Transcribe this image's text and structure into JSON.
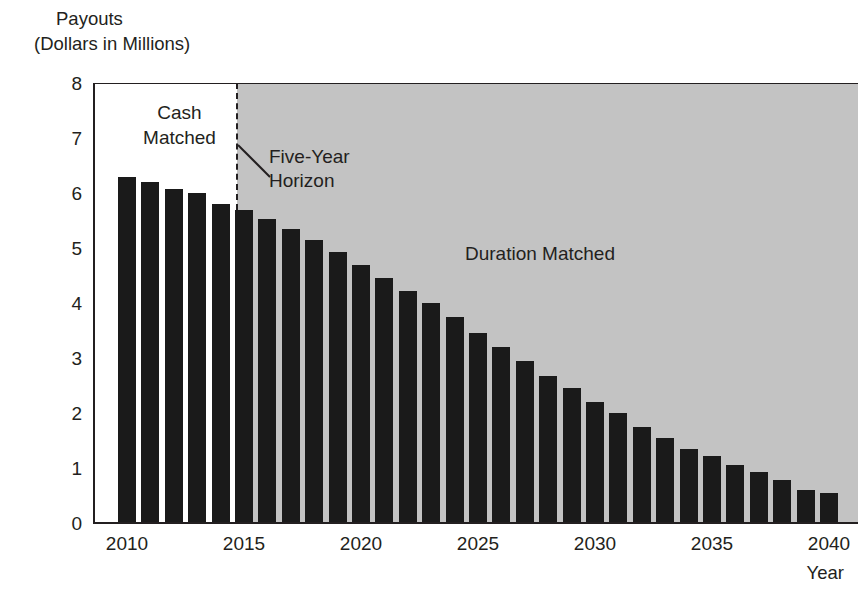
{
  "chart_data": {
    "type": "bar",
    "title": "",
    "ylabel_line1": "Payouts",
    "ylabel_line2": "(Dollars in Millions)",
    "xlabel": "Year",
    "ylim": [
      0,
      8
    ],
    "y_ticks": [
      "0",
      "1",
      "2",
      "3",
      "4",
      "5",
      "6",
      "7",
      "8"
    ],
    "x_ticks": [
      "2010",
      "2015",
      "2020",
      "2025",
      "2030",
      "2035",
      "2040"
    ],
    "grid": false,
    "legend_position": "in-plot-annotations",
    "categories": [
      "2010",
      "2011",
      "2012",
      "2013",
      "2014",
      "2015",
      "2016",
      "2017",
      "2018",
      "2019",
      "2020",
      "2021",
      "2022",
      "2023",
      "2024",
      "2025",
      "2026",
      "2027",
      "2028",
      "2029",
      "2030",
      "2031",
      "2032",
      "2033",
      "2034",
      "2035",
      "2036",
      "2037",
      "2038",
      "2039",
      "2040"
    ],
    "values": [
      6.3,
      6.2,
      6.07,
      6.0,
      5.8,
      5.7,
      5.52,
      5.35,
      5.15,
      4.92,
      4.7,
      4.45,
      4.22,
      4.0,
      3.75,
      3.45,
      3.2,
      2.95,
      2.68,
      2.45,
      2.2,
      2.0,
      1.75,
      1.55,
      1.35,
      1.22,
      1.05,
      0.93,
      0.78,
      0.6,
      0.55
    ],
    "bar_color": "#1a1a1a",
    "annotations": [
      {
        "id": "cash-matched",
        "text_line1": "Cash",
        "text_line2": "Matched",
        "region": "2010-2014",
        "region_color": "#ffffff"
      },
      {
        "id": "five-year-horizon",
        "text_line1": "Five-Year",
        "text_line2": "Horizon",
        "marker": "dashed vertical line after 2014"
      },
      {
        "id": "duration-matched",
        "text": "Duration Matched",
        "region": "2015-2040",
        "region_color": "#c3c3c3"
      }
    ]
  },
  "labels": {
    "cash_matched_l1": "Cash",
    "cash_matched_l2": "Matched",
    "five_year_horizon_l1": "Five-Year",
    "five_year_horizon_l2": "Horizon",
    "duration_matched": "Duration Matched"
  }
}
